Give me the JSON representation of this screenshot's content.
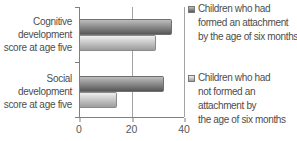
{
  "chart": {
    "categories": [
      {
        "lines": [
          "Cognitive",
          "development",
          "score at age five"
        ]
      },
      {
        "lines": [
          "Social",
          "development",
          "score at age five"
        ]
      }
    ],
    "xtick_labels": [
      "0",
      "20",
      "40"
    ],
    "legend": [
      {
        "lines": [
          "Children who had",
          "formed an attachment",
          "by the age of six months"
        ]
      },
      {
        "lines": [
          "Children who had",
          "not formed an",
          "attachment by",
          "the age of six months"
        ]
      }
    ]
  },
  "colors": {
    "bar_formed_top": "#bdbdbd",
    "bar_formed_bottom": "#575757",
    "bar_not_formed_top": "#efefef",
    "bar_not_formed_bottom": "#9c9c9c",
    "axis": "#7f7f7f",
    "gridline": "#a3a3a3",
    "text": "#4d4d4d"
  },
  "chart_data": {
    "type": "bar",
    "orientation": "horizontal",
    "title": "",
    "xlabel": "",
    "ylabel": "",
    "categories": [
      "Cognitive development score at age five",
      "Social development score at age five"
    ],
    "series": [
      {
        "name": "Children who had formed an attachment by the age of six months",
        "values": [
          35,
          32
        ]
      },
      {
        "name": "Children who had not formed an attachment by the age of six months",
        "values": [
          29,
          14
        ]
      }
    ],
    "xlim": [
      0,
      40
    ],
    "xticks": [
      0,
      20,
      40
    ],
    "grid": true,
    "legend_position": "right"
  }
}
